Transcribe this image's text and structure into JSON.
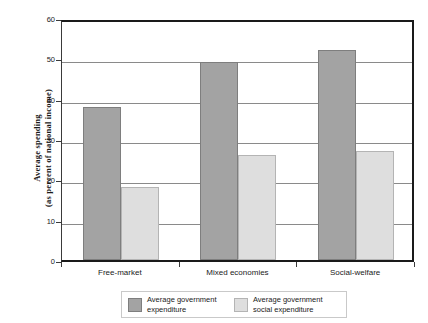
{
  "chart_data": {
    "type": "bar",
    "title": "",
    "xlabel": "",
    "ylabel_line1": "Average spending",
    "ylabel_line2": "(as percent of national income)",
    "categories": [
      "Free-market",
      "Mixed economies",
      "Social-welfare"
    ],
    "series": [
      {
        "name_line1": "Average government",
        "name_line2": "expenditure",
        "color": "#a3a3a3",
        "values": [
          38,
          49,
          52
        ]
      },
      {
        "name_line1": "Average government",
        "name_line2": "social expenditure",
        "color": "#dedede",
        "values": [
          18,
          26,
          27
        ]
      }
    ],
    "ylim": [
      0,
      60
    ],
    "yticks": [
      0,
      10,
      20,
      30,
      40,
      50,
      60
    ],
    "ytick_labels": [
      "0",
      "10",
      "20",
      "30",
      "40",
      "50",
      "60"
    ],
    "grid": true,
    "legend_position": "bottom"
  }
}
